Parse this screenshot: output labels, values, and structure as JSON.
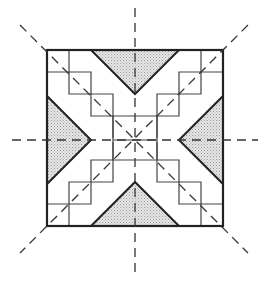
{
  "diagram": {
    "title": "",
    "colors": {
      "outline": "#222222",
      "grid": "#444444",
      "shade": "#d4d4d4",
      "axis": "#333333",
      "background": "#ffffff"
    },
    "square": {
      "x": 47,
      "y": 50,
      "size": 176
    },
    "center": {
      "x": 135,
      "y": 140
    },
    "symmetry_axes": [
      {
        "name": "vertical",
        "x1": 135,
        "y1": 8,
        "x2": 135,
        "y2": 275
      },
      {
        "name": "horizontal",
        "x1": 12,
        "y1": 140,
        "x2": 258,
        "y2": 140
      },
      {
        "name": "diagonal-main",
        "x1": 20,
        "y1": 25,
        "x2": 248,
        "y2": 253
      },
      {
        "name": "diagonal-anti",
        "x1": 248,
        "y1": 25,
        "x2": 20,
        "y2": 253
      }
    ],
    "shaded_triangles": [
      {
        "name": "top",
        "points": "91,50 179,50 135,94"
      },
      {
        "name": "bottom",
        "points": "91,226 179,226 135,182"
      },
      {
        "name": "left",
        "points": "47,96 47,184 91,140"
      },
      {
        "name": "right",
        "points": "223,96 223,184 179,140"
      }
    ]
  }
}
